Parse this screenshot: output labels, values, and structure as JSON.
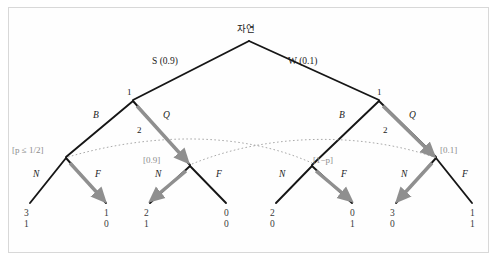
{
  "figure": {
    "type": "extensive-form-game-tree",
    "root": {
      "label": "자연",
      "x": 249,
      "y": 30
    },
    "chance_branches": [
      {
        "name": "S",
        "probability": "0.9",
        "label": "S (0.9)",
        "x": 168,
        "y": 62
      },
      {
        "name": "W",
        "probability": "0.1",
        "label": "W (0.1)",
        "x": 302,
        "y": 62
      }
    ],
    "player1_nodes": [
      {
        "label": "1",
        "x": 133,
        "y": 97
      },
      {
        "label": "1",
        "x": 379,
        "y": 97
      }
    ],
    "player1_actions": [
      {
        "label": "B",
        "x": 97,
        "y": 117
      },
      {
        "label": "Q",
        "x": 166,
        "y": 117
      },
      {
        "label": "B",
        "x": 343,
        "y": 117
      },
      {
        "label": "Q",
        "x": 412,
        "y": 117
      }
    ],
    "player2_nodes": [
      {
        "label": "2",
        "x": 140,
        "y": 131
      },
      {
        "label": "2",
        "x": 386,
        "y": 131
      }
    ],
    "beliefs": [
      {
        "label": "[p ≤ 1/2]",
        "math": "p ≤ 1/2",
        "x": 15,
        "y": 150,
        "anchor": "left"
      },
      {
        "label": "[0.9]",
        "math": "0.9",
        "x": 143,
        "y": 160,
        "anchor": "left"
      },
      {
        "label": "[1−p]",
        "math": "1−p",
        "x": 303,
        "y": 160,
        "anchor": "left"
      },
      {
        "label": "[0.1]",
        "math": "0.1",
        "x": 436,
        "y": 150,
        "anchor": "left"
      }
    ],
    "player2_actions": [
      {
        "label": "N",
        "x": 37,
        "y": 175
      },
      {
        "label": "F",
        "x": 95,
        "y": 175
      },
      {
        "label": "N",
        "x": 158,
        "y": 175
      },
      {
        "label": "F",
        "x": 216,
        "y": 175
      },
      {
        "label": "N",
        "x": 283,
        "y": 175
      },
      {
        "label": "F",
        "x": 341,
        "y": 175
      },
      {
        "label": "N",
        "x": 404,
        "y": 175
      },
      {
        "label": "F",
        "x": 462,
        "y": 175
      }
    ],
    "terminal_payoffs": [
      {
        "player1": "3",
        "player2": "1",
        "x": 25,
        "y": 212
      },
      {
        "player1": "1",
        "player2": "0",
        "x": 105,
        "y": 212
      },
      {
        "player1": "2",
        "player2": "1",
        "x": 145,
        "y": 212
      },
      {
        "player1": "0",
        "player2": "0",
        "x": 225,
        "y": 212
      },
      {
        "player1": "2",
        "player2": "0",
        "x": 271,
        "y": 212
      },
      {
        "player1": "0",
        "player2": "1",
        "x": 351,
        "y": 212
      },
      {
        "player1": "3",
        "player2": "0",
        "x": 391,
        "y": 212
      },
      {
        "player1": "1",
        "player2": "1",
        "x": 471,
        "y": 212
      }
    ],
    "equilibrium_path_arrows": [
      {
        "from": "player1-left",
        "action": "Q"
      },
      {
        "from": "player1-right",
        "action": "Q"
      },
      {
        "from": "player2-node-1",
        "action": "F"
      },
      {
        "from": "player2-node-2",
        "action": "N"
      },
      {
        "from": "player2-node-3",
        "action": "F"
      },
      {
        "from": "player2-node-4",
        "action": "N"
      }
    ],
    "information_sets": [
      {
        "connects": [
          "node-left-B",
          "node-right-B"
        ]
      },
      {
        "connects": [
          "node-left-Q",
          "node-right-Q"
        ]
      }
    ],
    "colors": {
      "line": "#161616",
      "arrow": "#8f8f8f",
      "belief_text": "#8c8c8c",
      "info_set_dotted": "#9a9a9a",
      "frame": "#d8d8d8",
      "background": "#ffffff"
    }
  }
}
